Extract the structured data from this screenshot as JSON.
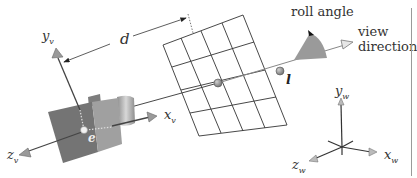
{
  "labels": {
    "d": "d",
    "y_v": {
      "base": "y",
      "sub": "v"
    },
    "x_v": {
      "base": "x",
      "sub": "v"
    },
    "z_v": {
      "base": "z",
      "sub": "v"
    },
    "e": "e",
    "l": "l",
    "roll_angle": "roll angle",
    "view_direction_line1": "view",
    "view_direction_line2": "direction",
    "y_w": {
      "base": "y",
      "sub": "w"
    },
    "x_w": {
      "base": "x",
      "sub": "w"
    },
    "z_w": {
      "base": "z",
      "sub": "w"
    }
  },
  "colors": {
    "line": "#333333",
    "camera_front": "#7a7a7a",
    "camera_side": "#9b9b9b",
    "cone": "#9e9e9e",
    "dot": "#8c8c8c",
    "rule": "#9a9a9a"
  }
}
